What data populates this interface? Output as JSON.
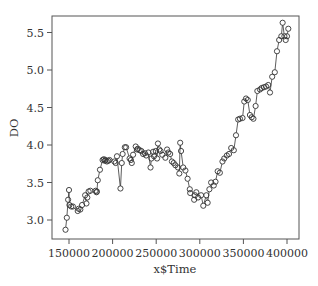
{
  "chart_data": {
    "type": "line",
    "title": "",
    "xlabel": "x$Time",
    "ylabel": "DO",
    "xlim": [
      138000,
      413000
    ],
    "ylim": [
      2.75,
      5.73
    ],
    "grid": false,
    "legend": null,
    "marker": "open-circle",
    "line_style": "solid, connecting consecutive points",
    "x_ticks": [
      150000,
      200000,
      250000,
      300000,
      350000,
      400000
    ],
    "x_tick_labels": [
      "150000",
      "200000",
      "250000",
      "300000",
      "350000",
      "400000"
    ],
    "y_ticks": [
      3.0,
      3.5,
      4.0,
      4.5,
      5.0,
      5.5
    ],
    "y_tick_labels": [
      "3.0",
      "3.5",
      "4.0",
      "4.5",
      "5.0",
      "5.5"
    ],
    "series": [
      {
        "name": "DO",
        "x": [
          146000,
          147500,
          149000,
          150000,
          150500,
          152500,
          154500,
          160000,
          161000,
          163000,
          165000,
          168500,
          170000,
          171000,
          172500,
          174500,
          180500,
          181500,
          182000,
          183000,
          185500,
          188500,
          190000,
          191000,
          192000,
          193500,
          195000,
          196500,
          202000,
          203500,
          205000,
          209000,
          210500,
          211500,
          214000,
          215500,
          219500,
          221000,
          222000,
          223500,
          226500,
          228000,
          229000,
          231000,
          233000,
          235000,
          237000,
          238500,
          241000,
          243500,
          244500,
          246500,
          247500,
          249500,
          251000,
          252000,
          253500,
          255000,
          257000,
          260500,
          262500,
          264000,
          266000,
          268000,
          270000,
          272000,
          275000,
          276500,
          277500,
          278500,
          281000,
          283500,
          286000,
          288500,
          289000,
          293500,
          294500,
          296000,
          298000,
          301500,
          304000,
          307500,
          309000,
          311000,
          313000,
          316000,
          318000,
          320500,
          323000,
          326000,
          328000,
          331000,
          333500,
          336000,
          339000,
          341500,
          344000,
          346000,
          349000,
          351000,
          353000,
          355000,
          357500,
          359500,
          361500,
          364000,
          366000,
          369000,
          371000,
          373500,
          376000,
          378500,
          380500,
          383000,
          386000,
          388500,
          391000,
          393500,
          395000,
          397000,
          398500,
          400000,
          401500
        ],
        "values": [
          2.87,
          3.03,
          3.27,
          3.4,
          3.2,
          3.18,
          3.18,
          3.12,
          3.15,
          3.14,
          3.2,
          3.33,
          3.22,
          3.3,
          3.38,
          3.39,
          3.39,
          3.37,
          3.38,
          3.53,
          3.67,
          3.8,
          3.81,
          3.79,
          3.8,
          3.78,
          3.79,
          3.8,
          3.78,
          3.76,
          3.85,
          3.42,
          3.76,
          3.88,
          3.97,
          3.97,
          3.82,
          3.8,
          3.76,
          3.87,
          3.98,
          3.94,
          3.95,
          3.93,
          3.92,
          3.88,
          3.89,
          3.86,
          3.9,
          3.7,
          3.82,
          3.91,
          3.85,
          3.92,
          3.82,
          4.02,
          3.94,
          3.92,
          3.87,
          3.83,
          3.94,
          3.9,
          3.88,
          3.78,
          3.76,
          3.73,
          3.7,
          3.62,
          4.03,
          3.92,
          3.7,
          3.66,
          3.55,
          3.41,
          3.36,
          3.27,
          3.33,
          3.37,
          3.3,
          3.33,
          3.19,
          3.33,
          3.23,
          3.41,
          3.5,
          3.46,
          3.51,
          3.65,
          3.63,
          3.78,
          3.82,
          3.86,
          3.88,
          3.96,
          3.93,
          4.13,
          4.34,
          4.35,
          4.36,
          4.58,
          4.62,
          4.6,
          4.4,
          4.37,
          4.35,
          4.52,
          4.72,
          4.74,
          4.76,
          4.77,
          4.78,
          4.8,
          4.7,
          4.91,
          4.97,
          5.25,
          5.4,
          5.45,
          5.63,
          5.45,
          5.4,
          5.45,
          5.55
        ]
      }
    ]
  },
  "plot_area": {
    "left": 52,
    "top": 16,
    "right": 299,
    "bottom": 239
  },
  "colors": {
    "points": "#333333",
    "axes": "#555555",
    "text": "#333333",
    "background": "#ffffff"
  }
}
